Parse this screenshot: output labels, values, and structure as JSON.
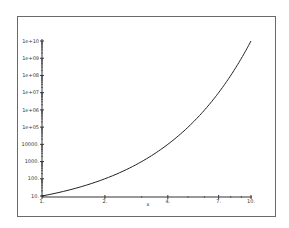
{
  "chart_data": {
    "type": "line",
    "title": "",
    "xlabel": "x",
    "ylabel": "",
    "xscale": "log",
    "yscale": "log",
    "xlim": [
      1,
      10
    ],
    "ylim": [
      10,
      10000000000
    ],
    "grid": false,
    "legend": null,
    "x_ticks": [
      {
        "value": 1,
        "label": "1."
      },
      {
        "value": 2,
        "label": "2."
      },
      {
        "value": 4,
        "label": "4."
      },
      {
        "value": 7,
        "label": "7."
      },
      {
        "value": 10,
        "label": "10."
      }
    ],
    "y_ticks": [
      {
        "value": 10,
        "label": "10."
      },
      {
        "value": 100,
        "label": "100."
      },
      {
        "value": 1000,
        "label": "1000."
      },
      {
        "value": 10000,
        "label": "10000."
      },
      {
        "value": 100000,
        "label": "1e+05"
      },
      {
        "value": 1000000,
        "label": "1e+06"
      },
      {
        "value": 10000000,
        "label": "1e+07"
      },
      {
        "value": 100000000,
        "label": "1e+08"
      },
      {
        "value": 1000000000,
        "label": "1e+09"
      },
      {
        "value": 10000000000,
        "label": "1e+10"
      }
    ],
    "series": [
      {
        "name": "y = 10^x",
        "x": [
          1,
          2,
          3,
          4,
          5,
          6,
          7,
          8,
          9,
          10
        ],
        "y": [
          10,
          100,
          1000,
          10000,
          100000,
          1000000,
          10000000,
          100000000,
          1000000000,
          10000000000
        ]
      }
    ],
    "colors": {
      "line": "#222222",
      "axis": "#333333",
      "frame": "#6a6a6a"
    }
  }
}
